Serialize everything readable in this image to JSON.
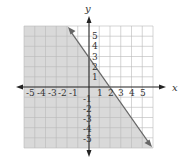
{
  "graph": {
    "title": "",
    "x_axis_label": "x",
    "y_axis_label": "y",
    "x_tick_labels": [
      "-5",
      "-4",
      "-3",
      "-2",
      "-1",
      "1",
      "2",
      "3",
      "4",
      "5"
    ],
    "y_tick_labels": [
      "5",
      "4",
      "3",
      "2",
      "1",
      "-1",
      "-2",
      "-3",
      "-4",
      "-5"
    ],
    "range": {
      "xmin": -6,
      "xmax": 6,
      "ymin": -6,
      "ymax": 6
    },
    "boundary_line": {
      "equation": "y = -3/2 x + 3",
      "slope": -1.5,
      "y_intercept": 3,
      "x_intercept": 2,
      "style": "solid"
    },
    "shaded_region": "below-left of line (y <= -3/2 x + 3)",
    "colors": {
      "shade": "#d9d9d9",
      "grid": "#b8b8b8",
      "axis": "#222222",
      "line": "#666666"
    }
  }
}
